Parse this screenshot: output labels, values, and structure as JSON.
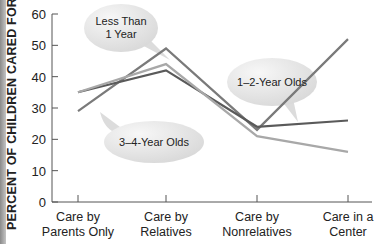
{
  "chart_data": {
    "type": "line",
    "title": "",
    "xlabel": "",
    "ylabel": "PERCENT OF CHILDREN CARED FOR",
    "ylim": [
      0,
      60
    ],
    "yticks": [
      0,
      10,
      20,
      30,
      40,
      50,
      60
    ],
    "grid": false,
    "categories": [
      "Care by Parents Only",
      "Care by Relatives",
      "Care by Nonrelatives",
      "Care in a Center"
    ],
    "category_lines": [
      [
        "Care by",
        "Parents Only"
      ],
      [
        "Care by",
        "Relatives"
      ],
      [
        "Care by",
        "Nonrelatives"
      ],
      [
        "Care in a",
        "Center"
      ]
    ],
    "series": [
      {
        "name": "Less Than 1 Year",
        "values": [
          29,
          49,
          23,
          52
        ],
        "color": "#7a7a7a"
      },
      {
        "name": "1–2-Year Olds",
        "values": [
          35,
          42,
          24,
          26
        ],
        "color": "#5a5a5a"
      },
      {
        "name": "3–4-Year Olds",
        "values": [
          35,
          44,
          21,
          16
        ],
        "color": "#a8a8a8"
      }
    ],
    "annotations": [
      {
        "text": "Less Than\n1 Year",
        "target_series": "Less Than 1 Year"
      },
      {
        "text": "1–2-Year Olds",
        "target_series": "1–2-Year Olds"
      },
      {
        "text": "3–4-Year Olds",
        "target_series": "3–4-Year Olds"
      }
    ],
    "legend": "callout bubbles"
  },
  "labels": {
    "bubble_less_than_1_line1": "Less Than",
    "bubble_less_than_1_line2": "1 Year",
    "bubble_1_2": "1–2-Year Olds",
    "bubble_3_4": "3–4-Year Olds"
  }
}
